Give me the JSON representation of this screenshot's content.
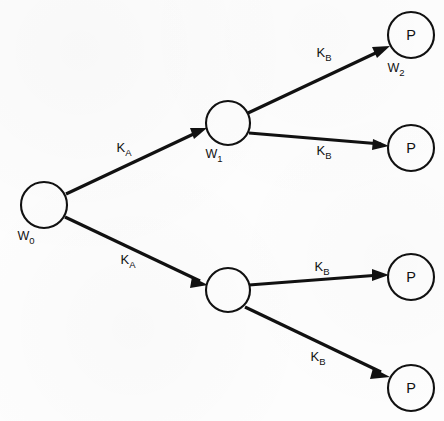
{
  "diagram": {
    "type": "branching-tree",
    "background_color": "#fdfdfd",
    "stroke_color": "#111111",
    "nodes": [
      {
        "id": "w0",
        "inner_text": "",
        "label_base": "W",
        "label_sub": "0",
        "cx": 44,
        "cy": 205,
        "r": 23
      },
      {
        "id": "w1",
        "inner_text": "",
        "label_base": "W",
        "label_sub": "1",
        "cx": 228,
        "cy": 123,
        "r": 22
      },
      {
        "id": "mid-lower",
        "inner_text": "",
        "label_base": "",
        "label_sub": "",
        "cx": 228,
        "cy": 290,
        "r": 22
      },
      {
        "id": "p1",
        "inner_text": "P",
        "label_base": "W",
        "label_sub": "2",
        "cx": 411,
        "cy": 35,
        "r": 23
      },
      {
        "id": "p2",
        "inner_text": "P",
        "label_base": "",
        "label_sub": "",
        "cx": 411,
        "cy": 148,
        "r": 23
      },
      {
        "id": "p3",
        "inner_text": "P",
        "label_base": "",
        "label_sub": "",
        "cx": 411,
        "cy": 277,
        "r": 23
      },
      {
        "id": "p4",
        "inner_text": "P",
        "label_base": "",
        "label_sub": "",
        "cx": 411,
        "cy": 388,
        "r": 23
      }
    ],
    "edges": [
      {
        "id": "e-w0-w1",
        "from": "w0",
        "to": "w1",
        "label_base": "K",
        "label_sub": "A",
        "label_x": 124,
        "label_y": 152
      },
      {
        "id": "e-w0-mid",
        "from": "w0",
        "to": "mid-lower",
        "label_base": "K",
        "label_sub": "A",
        "label_x": 128,
        "label_y": 264
      },
      {
        "id": "e-w1-p1",
        "from": "w1",
        "to": "p1",
        "label_base": "K",
        "label_sub": "B",
        "label_x": 324,
        "label_y": 57
      },
      {
        "id": "e-w1-p2",
        "from": "w1",
        "to": "p2",
        "label_base": "K",
        "label_sub": "B",
        "label_x": 324,
        "label_y": 155
      },
      {
        "id": "e-mid-p3",
        "from": "mid-lower",
        "to": "p3",
        "label_base": "K",
        "label_sub": "B",
        "label_x": 322,
        "label_y": 271
      },
      {
        "id": "e-mid-p4",
        "from": "mid-lower",
        "to": "p4",
        "label_base": "K",
        "label_sub": "B",
        "label_x": 318,
        "label_y": 361
      }
    ]
  }
}
